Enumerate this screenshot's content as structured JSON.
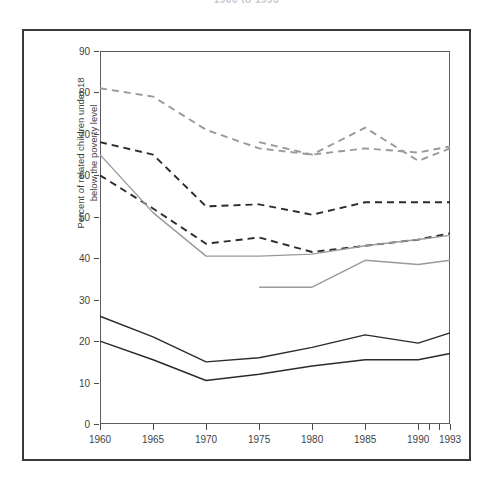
{
  "title": "1960 to 1993",
  "axes": {
    "y_label_line1": "Percent of related children under 18",
    "y_label_line2": "below the poverty level",
    "y_ticks": [
      "0",
      "10",
      "20",
      "30",
      "40",
      "50",
      "60",
      "70",
      "80",
      "90"
    ],
    "x_ticks": [
      "1960",
      "1965",
      "1970",
      "1975",
      "1980",
      "1985",
      "1990",
      "1993"
    ]
  },
  "colors": {
    "dark_line": "#2b2b2b",
    "gray_line": "#9a9a9a",
    "frame": "#3a3a3a",
    "axis": "#5d5d5d",
    "text": "#3f3f3f",
    "background": "#ffffff"
  },
  "chart_data": {
    "type": "line",
    "title": "1960 to 1993",
    "xlabel": "",
    "ylabel": "Percent of related children under 18 below the poverty level",
    "xlim": [
      1960,
      1993
    ],
    "ylim": [
      0,
      90
    ],
    "y_ticks": [
      0,
      10,
      20,
      30,
      40,
      50,
      60,
      70,
      80,
      90
    ],
    "x_ticks": [
      1960,
      1965,
      1970,
      1975,
      1980,
      1985,
      1990,
      1993
    ],
    "grid": false,
    "legend": "none",
    "series": [
      {
        "name": "gray-dashed-upper",
        "style": "dashed",
        "color": "#9a9a9a",
        "x": [
          1960,
          1965,
          1970,
          1975,
          1980,
          1985,
          1990,
          1993
        ],
        "values": [
          81,
          79,
          71,
          66.5,
          65,
          66.5,
          65.5,
          67
        ]
      },
      {
        "name": "gray-dashed-lower",
        "style": "dashed",
        "color": "#9a9a9a",
        "x": [
          1975,
          1980,
          1985,
          1990,
          1993
        ],
        "values": [
          68,
          65,
          71.5,
          63.5,
          66.5
        ]
      },
      {
        "name": "black-dashed-upper",
        "style": "dashed",
        "color": "#2b2b2b",
        "x": [
          1960,
          1965,
          1970,
          1975,
          1980,
          1985,
          1990,
          1993
        ],
        "values": [
          68,
          65,
          52.5,
          53,
          50.5,
          53.5,
          53.5,
          53.5
        ]
      },
      {
        "name": "black-dashed-lower",
        "style": "dashed",
        "color": "#2b2b2b",
        "x": [
          1960,
          1965,
          1970,
          1975,
          1980,
          1985,
          1990,
          1993
        ],
        "values": [
          60,
          52,
          43.5,
          45,
          41.5,
          43,
          44.5,
          46
        ]
      },
      {
        "name": "gray-solid-upper",
        "style": "solid",
        "color": "#9a9a9a",
        "x": [
          1960,
          1965,
          1970,
          1975,
          1980,
          1985,
          1990,
          1993
        ],
        "values": [
          65,
          51,
          40.5,
          40.5,
          41,
          43,
          44.5,
          45.5
        ]
      },
      {
        "name": "gray-solid-lower",
        "style": "solid",
        "color": "#9a9a9a",
        "x": [
          1975,
          1980,
          1985,
          1990,
          1993
        ],
        "values": [
          33,
          33,
          39.5,
          38.5,
          39.5
        ]
      },
      {
        "name": "black-solid-upper",
        "style": "solid",
        "color": "#2b2b2b",
        "x": [
          1960,
          1965,
          1970,
          1975,
          1980,
          1985,
          1990,
          1993
        ],
        "values": [
          26,
          21,
          15,
          16,
          18.5,
          21.5,
          19.5,
          22
        ]
      },
      {
        "name": "black-solid-lower",
        "style": "solid",
        "color": "#2b2b2b",
        "x": [
          1960,
          1965,
          1970,
          1975,
          1980,
          1985,
          1990,
          1993
        ],
        "values": [
          20,
          15.5,
          10.5,
          12,
          14,
          15.5,
          15.5,
          17
        ]
      }
    ]
  }
}
